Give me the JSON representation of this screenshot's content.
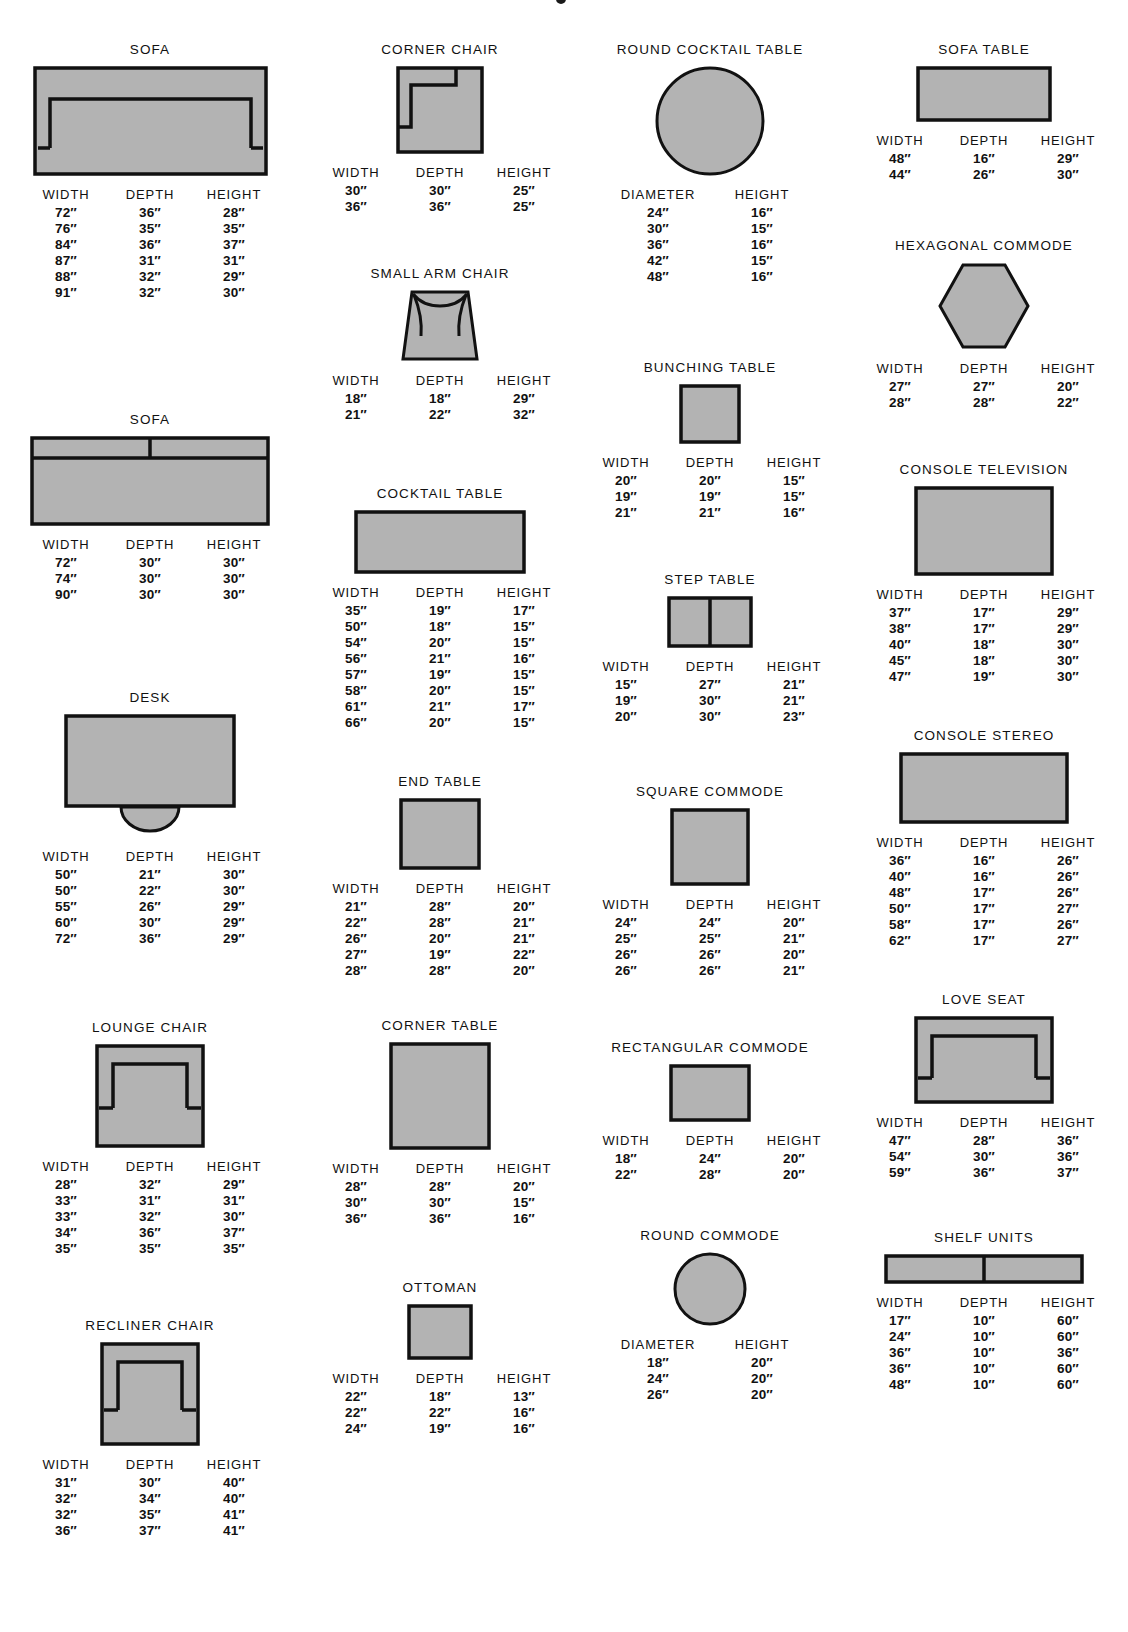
{
  "page": {
    "headers_3col": [
      "WIDTH",
      "DEPTH",
      "HEIGHT"
    ],
    "headers_round": [
      "DIAMETER",
      "HEIGHT"
    ],
    "fill_color": "#b3b3b3",
    "stroke_color": "#111111"
  },
  "columns": [
    {
      "id": "column-1",
      "entries": [
        {
          "name": "sofa-arm",
          "title": "SOFA",
          "shape": "sofa-arm",
          "headers": [
            "WIDTH",
            "DEPTH",
            "HEIGHT"
          ],
          "rows": [
            [
              "72″",
              "36″",
              "28″"
            ],
            [
              "76″",
              "35″",
              "35″"
            ],
            [
              "84″",
              "36″",
              "37″"
            ],
            [
              "87″",
              "31″",
              "31″"
            ],
            [
              "88″",
              "32″",
              "29″"
            ],
            [
              "91″",
              "32″",
              "30″"
            ]
          ]
        },
        {
          "name": "sofa-flat",
          "title": "SOFA",
          "shape": "sofa-flat",
          "headers": [
            "WIDTH",
            "DEPTH",
            "HEIGHT"
          ],
          "rows": [
            [
              "72″",
              "30″",
              "30″"
            ],
            [
              "74″",
              "30″",
              "30″"
            ],
            [
              "90″",
              "30″",
              "30″"
            ]
          ]
        },
        {
          "name": "desk",
          "title": "DESK",
          "shape": "desk",
          "headers": [
            "WIDTH",
            "DEPTH",
            "HEIGHT"
          ],
          "rows": [
            [
              "50″",
              "21″",
              "30″"
            ],
            [
              "50″",
              "22″",
              "30″"
            ],
            [
              "55″",
              "26″",
              "29″"
            ],
            [
              "60″",
              "30″",
              "29″"
            ],
            [
              "72″",
              "36″",
              "29″"
            ]
          ]
        },
        {
          "name": "lounge-chair",
          "title": "LOUNGE CHAIR",
          "shape": "lounge-chair",
          "headers": [
            "WIDTH",
            "DEPTH",
            "HEIGHT"
          ],
          "rows": [
            [
              "28″",
              "32″",
              "29″"
            ],
            [
              "33″",
              "31″",
              "31″"
            ],
            [
              "33″",
              "32″",
              "30″"
            ],
            [
              "34″",
              "36″",
              "37″"
            ],
            [
              "35″",
              "35″",
              "35″"
            ]
          ]
        },
        {
          "name": "recliner-chair",
          "title": "RECLINER CHAIR",
          "shape": "recliner-chair",
          "headers": [
            "WIDTH",
            "DEPTH",
            "HEIGHT"
          ],
          "rows": [
            [
              "31″",
              "30″",
              "40″"
            ],
            [
              "32″",
              "34″",
              "40″"
            ],
            [
              "32″",
              "35″",
              "41″"
            ],
            [
              "36″",
              "37″",
              "41″"
            ]
          ]
        }
      ]
    },
    {
      "id": "column-2",
      "entries": [
        {
          "name": "corner-chair",
          "title": "CORNER CHAIR",
          "shape": "corner-chair",
          "headers": [
            "WIDTH",
            "DEPTH",
            "HEIGHT"
          ],
          "rows": [
            [
              "30″",
              "30″",
              "25″"
            ],
            [
              "36″",
              "36″",
              "25″"
            ]
          ]
        },
        {
          "name": "small-arm-chair",
          "title": "SMALL ARM CHAIR",
          "shape": "small-arm-chair",
          "headers": [
            "WIDTH",
            "DEPTH",
            "HEIGHT"
          ],
          "rows": [
            [
              "18″",
              "18″",
              "29″"
            ],
            [
              "21″",
              "22″",
              "32″"
            ]
          ]
        },
        {
          "name": "cocktail-table",
          "title": "COCKTAIL TABLE",
          "shape": "cocktail-table",
          "headers": [
            "WIDTH",
            "DEPTH",
            "HEIGHT"
          ],
          "rows": [
            [
              "35″",
              "19″",
              "17″"
            ],
            [
              "50″",
              "18″",
              "15″"
            ],
            [
              "54″",
              "20″",
              "15″"
            ],
            [
              "56″",
              "21″",
              "16″"
            ],
            [
              "57″",
              "19″",
              "15″"
            ],
            [
              "58″",
              "20″",
              "15″"
            ],
            [
              "61″",
              "21″",
              "17″"
            ],
            [
              "66″",
              "20″",
              "15″"
            ]
          ]
        },
        {
          "name": "end-table",
          "title": "END TABLE",
          "shape": "end-table",
          "headers": [
            "WIDTH",
            "DEPTH",
            "HEIGHT"
          ],
          "rows": [
            [
              "21″",
              "28″",
              "20″"
            ],
            [
              "22″",
              "28″",
              "21″"
            ],
            [
              "26″",
              "20″",
              "21″"
            ],
            [
              "27″",
              "19″",
              "22″"
            ],
            [
              "28″",
              "28″",
              "20″"
            ]
          ]
        },
        {
          "name": "corner-table",
          "title": "CORNER TABLE",
          "shape": "corner-table",
          "headers": [
            "WIDTH",
            "DEPTH",
            "HEIGHT"
          ],
          "rows": [
            [
              "28″",
              "28″",
              "20″"
            ],
            [
              "30″",
              "30″",
              "15″"
            ],
            [
              "36″",
              "36″",
              "16″"
            ]
          ]
        },
        {
          "name": "ottoman",
          "title": "OTTOMAN",
          "shape": "ottoman",
          "headers": [
            "WIDTH",
            "DEPTH",
            "HEIGHT"
          ],
          "rows": [
            [
              "22″",
              "18″",
              "13″"
            ],
            [
              "22″",
              "22″",
              "16″"
            ],
            [
              "24″",
              "19″",
              "16″"
            ]
          ]
        }
      ]
    },
    {
      "id": "column-3",
      "entries": [
        {
          "name": "round-cocktail-table",
          "title": "ROUND COCKTAIL TABLE",
          "shape": "round-cocktail-table",
          "headers": [
            "DIAMETER",
            "HEIGHT"
          ],
          "rows": [
            [
              "24″",
              "16″"
            ],
            [
              "30″",
              "15″"
            ],
            [
              "36″",
              "16″"
            ],
            [
              "42″",
              "15″"
            ],
            [
              "48″",
              "16″"
            ]
          ]
        },
        {
          "name": "bunching-table",
          "title": "BUNCHING TABLE",
          "shape": "bunching-table",
          "headers": [
            "WIDTH",
            "DEPTH",
            "HEIGHT"
          ],
          "rows": [
            [
              "20″",
              "20″",
              "15″"
            ],
            [
              "19″",
              "19″",
              "15″"
            ],
            [
              "21″",
              "21″",
              "16″"
            ]
          ]
        },
        {
          "name": "step-table",
          "title": "STEP TABLE",
          "shape": "step-table",
          "headers": [
            "WIDTH",
            "DEPTH",
            "HEIGHT"
          ],
          "rows": [
            [
              "15″",
              "27″",
              "21″"
            ],
            [
              "19″",
              "30″",
              "21″"
            ],
            [
              "20″",
              "30″",
              "23″"
            ]
          ]
        },
        {
          "name": "square-commode",
          "title": "SQUARE COMMODE",
          "shape": "square-commode",
          "headers": [
            "WIDTH",
            "DEPTH",
            "HEIGHT"
          ],
          "rows": [
            [
              "24″",
              "24″",
              "20″"
            ],
            [
              "25″",
              "25″",
              "21″"
            ],
            [
              "26″",
              "26″",
              "20″"
            ],
            [
              "26″",
              "26″",
              "21″"
            ]
          ]
        },
        {
          "name": "rectangular-commode",
          "title": "RECTANGULAR COMMODE",
          "shape": "rectangular-commode",
          "headers": [
            "WIDTH",
            "DEPTH",
            "HEIGHT"
          ],
          "rows": [
            [
              "18″",
              "24″",
              "20″"
            ],
            [
              "22″",
              "28″",
              "20″"
            ]
          ]
        },
        {
          "name": "round-commode",
          "title": "ROUND COMMODE",
          "shape": "round-commode",
          "headers": [
            "DIAMETER",
            "HEIGHT"
          ],
          "rows": [
            [
              "18″",
              "20″"
            ],
            [
              "24″",
              "20″"
            ],
            [
              "26″",
              "20″"
            ]
          ]
        }
      ]
    },
    {
      "id": "column-4",
      "entries": [
        {
          "name": "sofa-table",
          "title": "SOFA TABLE",
          "shape": "sofa-table",
          "headers": [
            "WIDTH",
            "DEPTH",
            "HEIGHT"
          ],
          "rows": [
            [
              "48″",
              "16″",
              "29″"
            ],
            [
              "44″",
              "26″",
              "30″"
            ]
          ]
        },
        {
          "name": "hexagonal-commode",
          "title": "HEXAGONAL COMMODE",
          "shape": "hexagonal-commode",
          "headers": [
            "WIDTH",
            "DEPTH",
            "HEIGHT"
          ],
          "rows": [
            [
              "27″",
              "27″",
              "20″"
            ],
            [
              "28″",
              "28″",
              "22″"
            ]
          ]
        },
        {
          "name": "console-television",
          "title": "CONSOLE TELEVISION",
          "shape": "console-television",
          "headers": [
            "WIDTH",
            "DEPTH",
            "HEIGHT"
          ],
          "rows": [
            [
              "37″",
              "17″",
              "29″"
            ],
            [
              "38″",
              "17″",
              "29″"
            ],
            [
              "40″",
              "18″",
              "30″"
            ],
            [
              "45″",
              "18″",
              "30″"
            ],
            [
              "47″",
              "19″",
              "30″"
            ]
          ]
        },
        {
          "name": "console-stereo",
          "title": "CONSOLE STEREO",
          "shape": "console-stereo",
          "headers": [
            "WIDTH",
            "DEPTH",
            "HEIGHT"
          ],
          "rows": [
            [
              "36″",
              "16″",
              "26″"
            ],
            [
              "40″",
              "16″",
              "26″"
            ],
            [
              "48″",
              "17″",
              "26″"
            ],
            [
              "50″",
              "17″",
              "27″"
            ],
            [
              "58″",
              "17″",
              "26″"
            ],
            [
              "62″",
              "17″",
              "27″"
            ]
          ]
        },
        {
          "name": "love-seat",
          "title": "LOVE SEAT",
          "shape": "love-seat",
          "headers": [
            "WIDTH",
            "DEPTH",
            "HEIGHT"
          ],
          "rows": [
            [
              "47″",
              "28″",
              "36″"
            ],
            [
              "54″",
              "30″",
              "36″"
            ],
            [
              "59″",
              "36″",
              "37″"
            ]
          ]
        },
        {
          "name": "shelf-units",
          "title": "SHELF UNITS",
          "shape": "shelf-units",
          "headers": [
            "WIDTH",
            "DEPTH",
            "HEIGHT"
          ],
          "rows": [
            [
              "17″",
              "10″",
              "60″"
            ],
            [
              "24″",
              "10″",
              "60″"
            ],
            [
              "36″",
              "10″",
              "36″"
            ],
            [
              "36″",
              "10″",
              "60″"
            ],
            [
              "48″",
              "10″",
              "60″"
            ]
          ]
        }
      ]
    }
  ]
}
